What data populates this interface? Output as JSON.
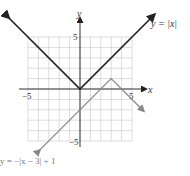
{
  "chart_data": {
    "type": "line",
    "title": "",
    "xlabel": "x",
    "ylabel": "y",
    "xlim": [
      -5,
      5
    ],
    "ylim": [
      -5,
      5
    ],
    "grid": true,
    "x_ticks_labeled": [
      "-5",
      "5"
    ],
    "y_ticks_labeled": [
      "5",
      "-5"
    ],
    "series": [
      {
        "name": "y = |x|",
        "color": "#222222",
        "points": [
          [
            -7,
            7
          ],
          [
            0,
            0
          ],
          [
            7,
            7
          ]
        ]
      },
      {
        "name": "y = −|x − 3| + 1",
        "color": "#8a8a8a",
        "points": [
          [
            -4,
            -6
          ],
          [
            3,
            1
          ],
          [
            6,
            -2
          ]
        ]
      }
    ]
  },
  "labels": {
    "x_axis": "x",
    "y_axis": "y",
    "x_neg5": "−5",
    "x_pos5": "5",
    "y_pos5": "5",
    "y_neg5": "−5",
    "curve1": "y = |x|",
    "curve2": "y = −|x − 3| + 1"
  }
}
